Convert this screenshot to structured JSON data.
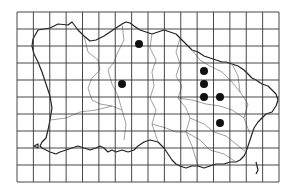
{
  "map": {
    "title": "Distribution map",
    "background": "#ffffff",
    "grid": {
      "x0": 17,
      "y0": 12,
      "x1": 279,
      "y1": 182,
      "cols": 16,
      "rows": 10,
      "color": "#333333"
    },
    "coast_color": "#222222",
    "boundary_color": "#777777",
    "dot_color": "#111111",
    "dots": [
      {
        "x": 139,
        "y": 44
      },
      {
        "x": 122,
        "y": 84
      },
      {
        "x": 204,
        "y": 71
      },
      {
        "x": 204,
        "y": 84
      },
      {
        "x": 204,
        "y": 97
      },
      {
        "x": 220,
        "y": 97
      },
      {
        "x": 220,
        "y": 123
      }
    ]
  }
}
